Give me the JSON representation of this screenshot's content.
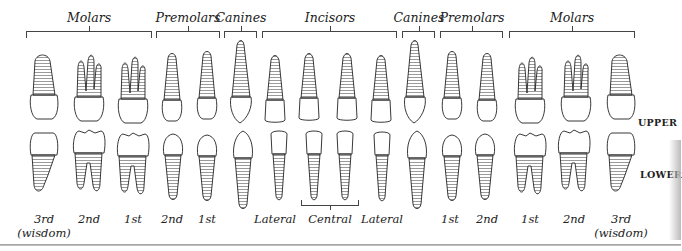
{
  "diagram": {
    "groups": [
      {
        "label": "Molars",
        "x1": 26,
        "x2": 152
      },
      {
        "label": "Premolars",
        "x1": 156,
        "x2": 220
      },
      {
        "label": "Canines",
        "x1": 224,
        "x2": 257
      },
      {
        "label": "Incisors",
        "x1": 262,
        "x2": 397
      },
      {
        "label": "Canines",
        "x1": 402,
        "x2": 435
      },
      {
        "label": "Premolars",
        "x1": 440,
        "x2": 503
      },
      {
        "label": "Molars",
        "x1": 509,
        "x2": 635
      }
    ],
    "row_labels": {
      "upper": "UPPER",
      "lower": "LOWER"
    },
    "tooth_labels": [
      {
        "text": "3rd",
        "sub": "(wisdom)",
        "x": 44
      },
      {
        "text": "2nd",
        "sub": "",
        "x": 89
      },
      {
        "text": "1st",
        "sub": "",
        "x": 133
      },
      {
        "text": "2nd",
        "sub": "",
        "x": 172
      },
      {
        "text": "1st",
        "sub": "",
        "x": 207
      },
      {
        "text": "Lateral",
        "sub": "",
        "x": 275
      },
      {
        "text": "Central",
        "sub": "",
        "x": 330
      },
      {
        "text": "Lateral",
        "sub": "",
        "x": 382
      },
      {
        "text": "1st",
        "sub": "",
        "x": 450
      },
      {
        "text": "2nd",
        "sub": "",
        "x": 487
      },
      {
        "text": "1st",
        "sub": "",
        "x": 530
      },
      {
        "text": "2nd",
        "sub": "",
        "x": 574
      },
      {
        "text": "3rd",
        "sub": "(wisdom)",
        "x": 621
      }
    ],
    "central_bracket": {
      "x1": 301,
      "x2": 359
    }
  }
}
